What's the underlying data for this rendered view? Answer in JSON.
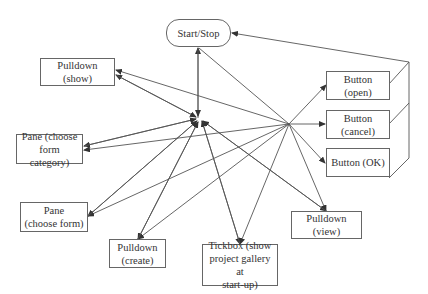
{
  "nodes": {
    "start_stop": "Start/Stop",
    "pulldown_show": "Pulldown (show)",
    "pane_category_1": "Pane (choose",
    "pane_category_2": "form category)",
    "pane_form_1": "Pane",
    "pane_form_2": "(choose form)",
    "pulldown_create_1": "Pulldown",
    "pulldown_create_2": "(create)",
    "tickbox_1": "Tickbox (show",
    "tickbox_2": "project gallery at",
    "tickbox_3": "start-up)",
    "pulldown_view": "Pulldown (view)",
    "button_open_1": "Button",
    "button_open_2": "(open)",
    "button_cancel_1": "Button",
    "button_cancel_2": "(cancel)",
    "button_ok": "Button (OK)"
  },
  "colors": {
    "line": "#444444",
    "border": "#666666",
    "text": "#333333"
  }
}
